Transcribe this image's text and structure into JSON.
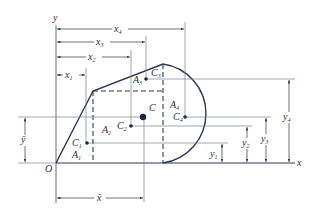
{
  "figure": {
    "type": "composite-area centroid diagram",
    "colors": {
      "outline": "#2c3554",
      "thin": "#7a7f92",
      "text": "#2a2f45",
      "background": "#ffffff"
    },
    "axes": {
      "x_label": "x",
      "y_label": "y",
      "origin_label": "O"
    },
    "centroid": {
      "label": "C",
      "xbar_label": "x̄",
      "ybar_label": "ȳ"
    },
    "parts": [
      {
        "area": "A",
        "area_sub": "1",
        "centroid": "C",
        "centroid_sub": "1",
        "x_dim": "x",
        "x_sub": "1",
        "y_dim": "y",
        "y_sub": "1"
      },
      {
        "area": "A",
        "area_sub": "2",
        "centroid": "C",
        "centroid_sub": "2",
        "x_dim": "x",
        "x_sub": "2",
        "y_dim": "y",
        "y_sub": "2"
      },
      {
        "area": "A",
        "area_sub": "3",
        "centroid": "C",
        "centroid_sub": "3",
        "x_dim": "x",
        "x_sub": "3",
        "y_dim": "y",
        "y_sub": "3"
      },
      {
        "area": "A",
        "area_sub": "4",
        "centroid": "C",
        "centroid_sub": "4",
        "x_dim": "x",
        "x_sub": "4",
        "y_dim": "y",
        "y_sub": "4"
      }
    ]
  }
}
